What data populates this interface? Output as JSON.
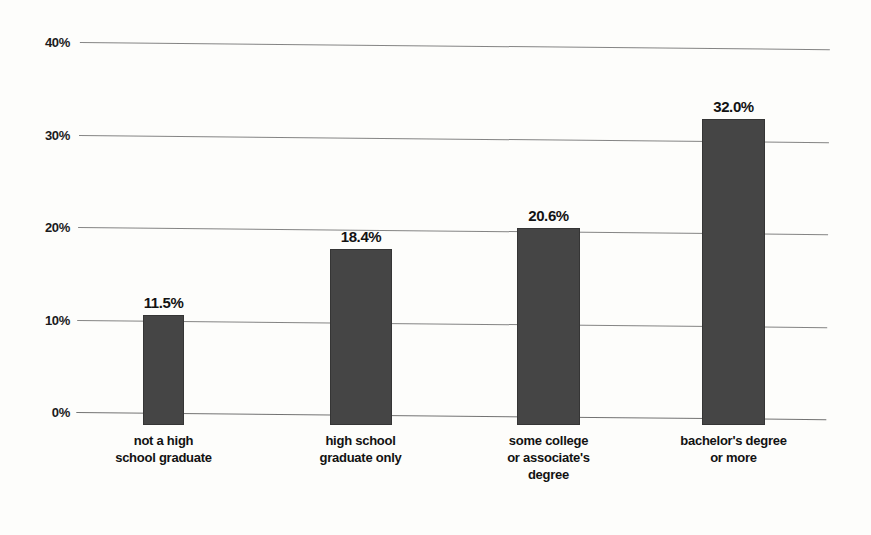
{
  "chart_data": {
    "type": "bar",
    "title": "",
    "subtitle": "",
    "xlabel": "",
    "ylabel": "",
    "ylim": [
      0,
      40
    ],
    "ytick_labels": [
      "40%",
      "30%",
      "20%",
      "10%",
      "0%"
    ],
    "ytick_values": [
      40,
      30,
      20,
      10,
      0
    ],
    "grid": true,
    "legend": null,
    "orientation": "vertical",
    "categories": [
      "not a high school graduate",
      "high school graduate only",
      "some college or associate's degree",
      "bachelor's degree or more"
    ],
    "category_lines": [
      [
        "not a high",
        "school graduate"
      ],
      [
        "high school",
        "graduate only"
      ],
      [
        "some college",
        "or associate's",
        "degree"
      ],
      [
        "bachelor's degree",
        "or more"
      ]
    ],
    "values": [
      11.5,
      18.4,
      20.6,
      32.0
    ],
    "value_labels": [
      "11.5%",
      "18.4%",
      "20.6%",
      "32.0%"
    ],
    "bar_color": "#454545",
    "gridline_color": "#6e6e6e",
    "text_color": "#131313",
    "background_color": "#fdfdfb"
  }
}
